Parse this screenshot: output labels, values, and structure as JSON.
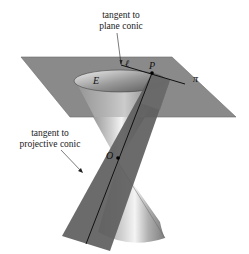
{
  "figure": {
    "labels": {
      "tangent_plane_line1": "tangent to",
      "tangent_plane_line2": "plane conic",
      "tangent_proj_line1": "tangent to",
      "tangent_proj_line2": "projective conic",
      "E": "E",
      "ell": "ℓ",
      "P": "P",
      "pi": "π",
      "O": "O"
    },
    "colors": {
      "plane": "#8a8a8a",
      "tangent_plane_strip": "#5e5e5e",
      "cone_light": "#e6e6e6",
      "cone_dark": "#7a7a7a",
      "line": "#111111"
    }
  }
}
